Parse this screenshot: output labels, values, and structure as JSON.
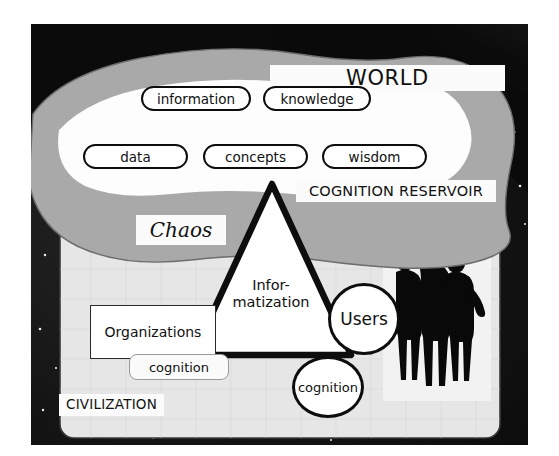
{
  "top_strip": {
    "ghost_text": ""
  },
  "figure": {
    "background": {
      "name": "space-earth-photo",
      "sky_color": "#0b0b0b",
      "star_color": "#e8e8e8"
    },
    "regions": {
      "chaos": {
        "label": "Chaos",
        "fill": "#a9a9a9"
      },
      "cognition_reservoir": {
        "label": "COGNITION RESERVOIR",
        "fill": "#fdfdfd"
      },
      "world": {
        "label": "WORLD"
      },
      "civilization": {
        "label": "CIVILIZATION",
        "fill": "#e9e9e9"
      }
    },
    "reservoir_pills": [
      {
        "id": "information",
        "label": "information"
      },
      {
        "id": "knowledge",
        "label": "knowledge"
      },
      {
        "id": "data",
        "label": "data"
      },
      {
        "id": "concepts",
        "label": "concepts"
      },
      {
        "id": "wisdom",
        "label": "wisdom"
      }
    ],
    "triangle": {
      "line1": "Infor-",
      "line2": "matization",
      "stroke": "#0d0d0d"
    },
    "organizations": {
      "label": "Organizations",
      "cognition_label": "cognition"
    },
    "users": {
      "label": "Users",
      "cognition_label": "cognition"
    },
    "people": {
      "name": "three-people-silhouette",
      "count": 3,
      "fill": "#0a0a0a"
    }
  }
}
